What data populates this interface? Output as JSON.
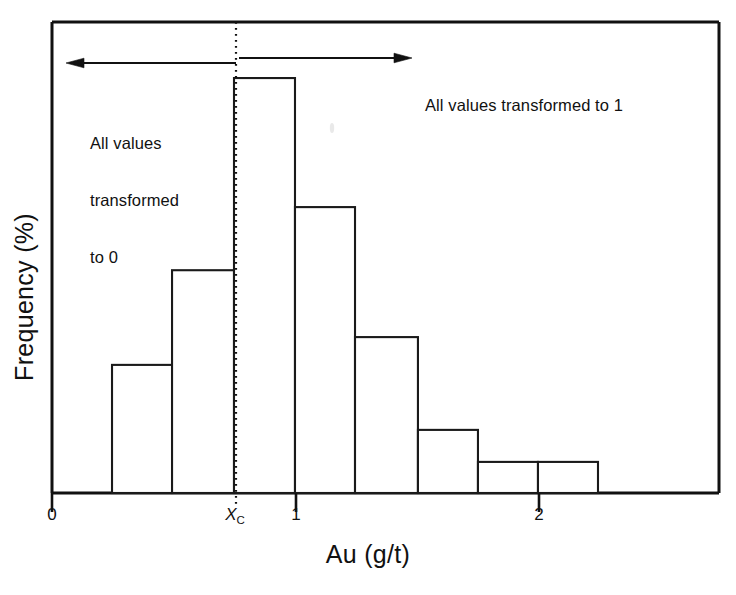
{
  "chart_data": {
    "type": "bar",
    "title": "",
    "subtitle": "",
    "xlabel": "Au (g/t)",
    "ylabel": "Frequency (%)",
    "xlim": [
      0,
      2.745
    ],
    "ylim": [
      0,
      100
    ],
    "grid": false,
    "legend": null,
    "bin_width": 0.247,
    "bin_edges": [
      0.247,
      0.494,
      0.749,
      1.0,
      1.247,
      1.506,
      1.753,
      2.0,
      2.247,
      2.494
    ],
    "categories": [
      "0.25-0.49",
      "0.49-0.75",
      "0.75-1.00",
      "1.00-1.25",
      "1.25-1.51",
      "1.51-1.75",
      "1.75-2.00",
      "2.00-2.25",
      "2.25-2.49"
    ],
    "values": [
      20.4,
      27.2,
      47.3,
      88.1,
      60.7,
      33.1,
      13.4,
      6.6,
      6.6
    ],
    "xticks": [
      {
        "value": 0,
        "label": "0"
      },
      {
        "value": 0.749,
        "label": "Xc",
        "label_main": "X",
        "label_sub": "C",
        "italic": true
      },
      {
        "value": 1,
        "label": "1"
      },
      {
        "value": 2,
        "label": "2"
      }
    ],
    "yticks": [],
    "annotations": [
      {
        "id": "cutoff-line",
        "type": "vertical-dotted-line",
        "x_value": 0.749,
        "label": "Xc"
      },
      {
        "id": "left-arrow",
        "type": "arrow",
        "direction": "left",
        "from_x": 0.749,
        "to_x": 0.095
      },
      {
        "id": "right-arrow",
        "type": "arrow",
        "direction": "right",
        "from_x": 0.762,
        "to_x": 1.449
      },
      {
        "id": "left-note",
        "type": "text",
        "text": "All values\ntransformed\nto 0"
      },
      {
        "id": "right-note",
        "type": "text",
        "text": "All values transformed to 1"
      }
    ],
    "colors": {
      "bar_fill": "#ffffff",
      "bar_stroke": "#1a1a1a",
      "axis": "#111111",
      "background": "#ffffff",
      "annotation_text": "#111111"
    }
  },
  "annotations": {
    "left_note_line1": "All values",
    "left_note_line2": "transformed",
    "left_note_line3": "to 0",
    "right_note": "All values transformed to 1"
  },
  "axes": {
    "x_title": "Au (g/t)",
    "y_title": "Frequency (%)",
    "tick_0": "0",
    "tick_xc_main": "X",
    "tick_xc_sub": "C",
    "tick_1": "1",
    "tick_2": "2"
  }
}
